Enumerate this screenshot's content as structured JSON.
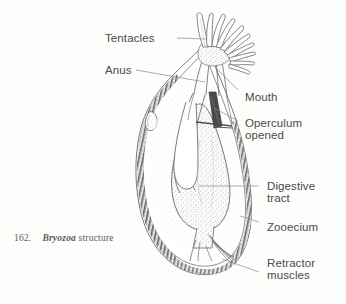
{
  "figure": {
    "caption_number": "162.",
    "caption_taxon": "Bryozoa",
    "caption_rest": " structure",
    "ink_color": "#5a5a5a",
    "label_color": "#4a4a4a",
    "background_color": "#fdfdfc"
  },
  "labels": {
    "tentacles": "Tentacles",
    "anus": "Anus",
    "mouth": "Mouth",
    "operculum_line1": "Operculum",
    "operculum_line2": "opened",
    "digestive_line1": "Digestive",
    "digestive_line2": "tract",
    "zooecium": "Zooecium",
    "retractor_line1": "Retractor",
    "retractor_line2": "muscles"
  },
  "structures": {
    "tentacle_count": 10,
    "lophophore_center": "215,58",
    "zooecium_outline": "pear-shaped body wall",
    "digestive_tract": "U-shaped gut loop",
    "retractor_muscles": "fan of fibres from stomach base to basal wall"
  }
}
